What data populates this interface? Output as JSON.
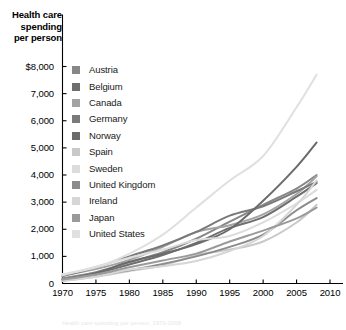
{
  "title": {
    "line1": "Health care",
    "line2": "spending",
    "line3": "per person"
  },
  "footnote": "Health care spending per person, 1970-2008",
  "axis": {
    "y_ticks": [
      "$8,000",
      "7,000",
      "6,000",
      "5,000",
      "4,000",
      "3,000",
      "2,000",
      "1,000",
      "0"
    ],
    "x_ticks": [
      "1970",
      "1975",
      "1980",
      "1985",
      "1990",
      "1995",
      "2000",
      "2005",
      "2010"
    ]
  },
  "legend": {
    "items": [
      {
        "label": "Austria",
        "color": "#878787"
      },
      {
        "label": "Belgium",
        "color": "#6e6e6e"
      },
      {
        "label": "Canada",
        "color": "#a3a3a3"
      },
      {
        "label": "Germany",
        "color": "#7a7a7a"
      },
      {
        "label": "Norway",
        "color": "#6b6b6b"
      },
      {
        "label": "Spain",
        "color": "#c9c9c9"
      },
      {
        "label": "Sweden",
        "color": "#dcdcdc"
      },
      {
        "label": "United Kingdom",
        "color": "#8c8c8c"
      },
      {
        "label": "Ireland",
        "color": "#d6d6d6"
      },
      {
        "label": "Japan",
        "color": "#9a9a9a"
      },
      {
        "label": "United States",
        "color": "#e0e0e0"
      }
    ]
  },
  "chart_data": {
    "type": "line",
    "title": "Health care spending per person",
    "xlabel": "",
    "ylabel": "Health care spending per person",
    "xlim": [
      1970,
      2010
    ],
    "ylim": [
      0,
      8000
    ],
    "grid": false,
    "legend_position": "inside-upper-left",
    "x": [
      1970,
      1975,
      1980,
      1985,
      1990,
      1995,
      2000,
      2005,
      2008
    ],
    "series": [
      {
        "name": "Austria",
        "color": "#878787",
        "values": [
          190,
          420,
          780,
          1150,
          1650,
          2280,
          2900,
          3500,
          4000
        ]
      },
      {
        "name": "Belgium",
        "color": "#6e6e6e",
        "values": [
          150,
          370,
          700,
          1050,
          1500,
          2050,
          2450,
          3200,
          3700
        ]
      },
      {
        "name": "Canada",
        "color": "#a3a3a3",
        "values": [
          290,
          530,
          870,
          1350,
          1900,
          2150,
          2550,
          3300,
          3950
        ]
      },
      {
        "name": "Germany",
        "color": "#7a7a7a",
        "values": [
          270,
          600,
          1000,
          1400,
          1900,
          2500,
          2850,
          3400,
          3750
        ]
      },
      {
        "name": "Norway",
        "color": "#6b6b6b",
        "values": [
          140,
          390,
          800,
          1100,
          1450,
          2000,
          3050,
          4300,
          5200
        ]
      },
      {
        "name": "Spain",
        "color": "#c9c9c9",
        "values": [
          95,
          250,
          460,
          660,
          1050,
          1250,
          1550,
          2250,
          2900
        ]
      },
      {
        "name": "Sweden",
        "color": "#dcdcdc",
        "values": [
          300,
          620,
          950,
          1250,
          1600,
          1750,
          2250,
          2950,
          3450
        ]
      },
      {
        "name": "United Kingdom",
        "color": "#8c8c8c",
        "values": [
          160,
          310,
          490,
          720,
          1000,
          1350,
          1800,
          2700,
          3150
        ]
      },
      {
        "name": "Ireland",
        "color": "#d6d6d6",
        "values": [
          105,
          260,
          510,
          640,
          830,
          1200,
          1750,
          2900,
          3800
        ]
      },
      {
        "name": "Japan",
        "color": "#9a9a9a",
        "values": [
          140,
          330,
          600,
          850,
          1100,
          1550,
          1950,
          2400,
          2800
        ]
      },
      {
        "name": "United States",
        "color": "#e0e0e0",
        "values": [
          350,
          600,
          1100,
          1800,
          2800,
          3800,
          4700,
          6500,
          7700
        ]
      }
    ]
  }
}
